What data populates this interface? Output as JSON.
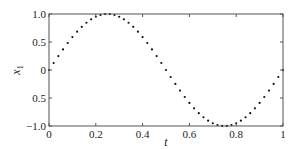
{
  "chart_data": {
    "type": "scatter",
    "title": "",
    "xlabel": "t",
    "ylabel": "x1",
    "ylabel_main": "x",
    "ylabel_sub": "1",
    "xlim": [
      0,
      1
    ],
    "ylim": [
      -1,
      1
    ],
    "grid": false,
    "legend": null,
    "x_ticks": [
      0,
      0.2,
      0.4,
      0.6,
      0.8,
      1
    ],
    "x_tick_labels": [
      "0",
      "0.2",
      "0.4",
      "0.6",
      "0.8",
      "1"
    ],
    "y_ticks": [
      1.0,
      0.5,
      0,
      -0.5,
      -1.0
    ],
    "y_tick_labels": [
      "1.0",
      "0.5",
      "0",
      "0.5",
      "−1.0"
    ],
    "marker": "dot",
    "color": "#111111",
    "series": [
      {
        "name": "x1(t) = sin(2πt)",
        "x": [
          0,
          0.02,
          0.04,
          0.06,
          0.08,
          0.1,
          0.12,
          0.14,
          0.16,
          0.18,
          0.2,
          0.22,
          0.24,
          0.26,
          0.28,
          0.3,
          0.32,
          0.34,
          0.36,
          0.38,
          0.4,
          0.42,
          0.44,
          0.46,
          0.48,
          0.5,
          0.52,
          0.54,
          0.56,
          0.58,
          0.6,
          0.62,
          0.64,
          0.66,
          0.68,
          0.7,
          0.72,
          0.74,
          0.76,
          0.78,
          0.8,
          0.82,
          0.84,
          0.86,
          0.88,
          0.9,
          0.92,
          0.94,
          0.96,
          0.98,
          1.0
        ],
        "y": [
          0,
          0.125,
          0.249,
          0.368,
          0.482,
          0.588,
          0.685,
          0.771,
          0.844,
          0.905,
          0.951,
          0.982,
          0.998,
          0.998,
          0.982,
          0.951,
          0.905,
          0.844,
          0.771,
          0.685,
          0.588,
          0.482,
          0.368,
          0.249,
          0.125,
          0,
          -0.125,
          -0.249,
          -0.368,
          -0.482,
          -0.588,
          -0.685,
          -0.771,
          -0.844,
          -0.905,
          -0.951,
          -0.982,
          -0.998,
          -0.998,
          -0.982,
          -0.951,
          -0.905,
          -0.844,
          -0.771,
          -0.685,
          -0.588,
          -0.482,
          -0.368,
          -0.249,
          -0.125,
          0
        ]
      }
    ]
  }
}
